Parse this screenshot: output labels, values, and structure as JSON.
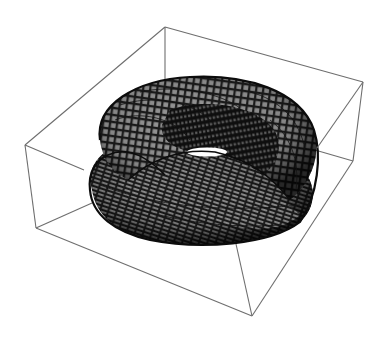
{
  "figure": {
    "type": "3d-surface-plot",
    "box_style": "wireframe bounding box, no axes ticks or labels",
    "colors": {
      "background": "#ffffff",
      "box_edge": "#6e6e6e",
      "mesh_line": "#0c0c0c",
      "face_light": "#a8a8a8",
      "face_dark": "#2a2a2a",
      "hole_highlight": "#ffffff"
    },
    "box_vertices_px": {
      "top_back": [
        165,
        27
      ],
      "top_right": [
        363,
        82
      ],
      "top_left": [
        25,
        145
      ],
      "top_front": [
        236,
        222
      ],
      "bottom_left": [
        36,
        228
      ],
      "bottom_right": [
        353,
        161
      ],
      "bottom_front": [
        252,
        316
      ]
    }
  }
}
